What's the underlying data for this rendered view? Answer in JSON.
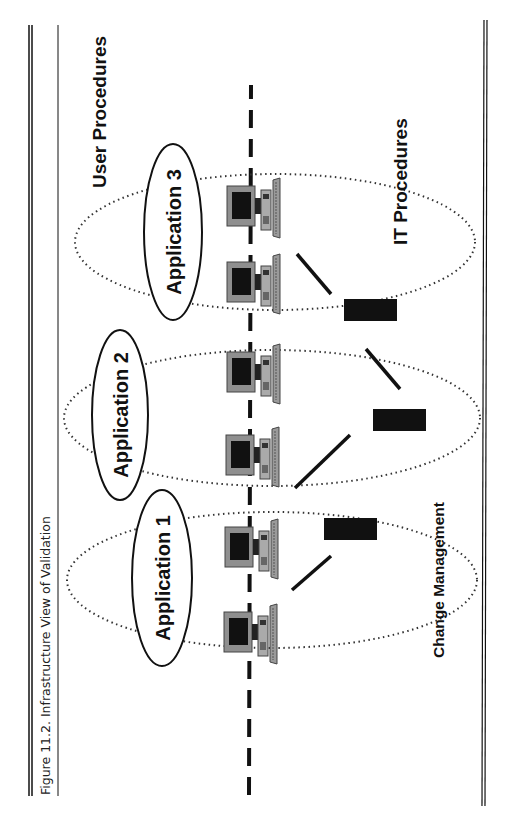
{
  "figure": {
    "caption": "Figure 11.2. Infrastructure View of Validation",
    "orientation": "rotated-90-ccw"
  },
  "labels": {
    "user_procedures": "User Procedures",
    "it_procedures": "IT Procedures",
    "change_management": "Change Management"
  },
  "applications": [
    {
      "label": "Application 1"
    },
    {
      "label": "Application 2"
    },
    {
      "label": "Application 3"
    }
  ],
  "workstations": [
    {
      "name": "workstation-1"
    },
    {
      "name": "workstation-2"
    },
    {
      "name": "workstation-3"
    },
    {
      "name": "workstation-4"
    },
    {
      "name": "workstation-5"
    },
    {
      "name": "workstation-6"
    }
  ],
  "servers": [
    {
      "name": "server-1"
    },
    {
      "name": "server-2"
    },
    {
      "name": "server-3"
    }
  ],
  "colors": {
    "ink": "#111111",
    "monitor_frame": "#8a8a8a",
    "screen": "#111111",
    "dotted": "#333333"
  }
}
